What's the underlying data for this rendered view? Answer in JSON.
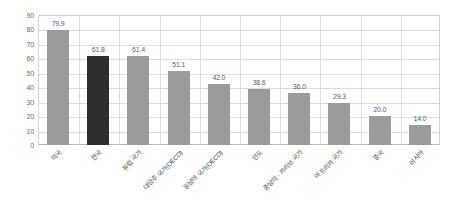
{
  "chart_data": {
    "type": "bar",
    "title": "",
    "subtitle": "",
    "xlabel": "",
    "ylabel": "",
    "ylim": [
      0,
      90
    ],
    "yticks": [
      0,
      10,
      20,
      30,
      40,
      50,
      60,
      70,
      80,
      90
    ],
    "grid": true,
    "legend": "none",
    "categories": [
      "미국",
      "한국",
      "유럽 국가",
      "대양주 국가(OECD)",
      "동남아 국가(OECD)",
      "인도",
      "중남미 · 카리브 국가",
      "아프리카 국가",
      "중국",
      "러시아"
    ],
    "values": [
      79.9,
      61.8,
      61.4,
      51.1,
      42.0,
      38.6,
      36.0,
      29.3,
      20.0,
      14.0
    ],
    "value_labels": [
      "79.9",
      "61.8",
      "61.4",
      "51.1",
      "42.0",
      "38.6",
      "36.0",
      "29.3",
      "20.0",
      "14.0"
    ],
    "highlight_index": 1,
    "colors": {
      "bar": "#9b9b9b",
      "bar_highlight": "#2e2e2e",
      "grid": "#dcdcdc",
      "axis": "#b8b8b8",
      "text": "#5d5d5d",
      "background": "#ffffff"
    }
  }
}
